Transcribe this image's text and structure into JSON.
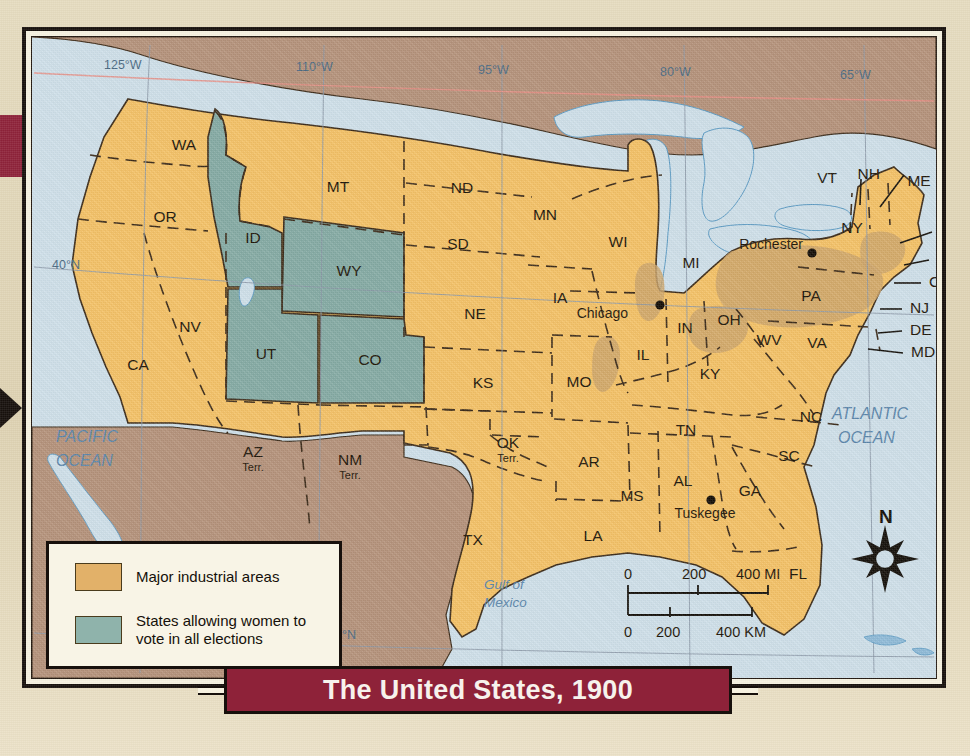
{
  "title": "The United States, 1900",
  "colors": {
    "state_fill": "#f5c266",
    "suffrage_fill": "#85aba4",
    "industrial_fill": "#cda56a",
    "foreign_fill": "#b5927a",
    "water": "#cfe0ea",
    "banner": "#8e2239",
    "border": "#17100c",
    "paper": "#ded2b2"
  },
  "legend": {
    "items": [
      {
        "swatch_color": "#e2b169",
        "label": "Major industrial areas"
      },
      {
        "swatch_color": "#8fb3ab",
        "label": "States allowing women to\nvote in all elections"
      }
    ]
  },
  "graticule": {
    "longitude_labels": [
      "125°W",
      "110°W",
      "95°W",
      "80°W",
      "65°W"
    ],
    "latitude_labels": [
      "40°N",
      "25°N"
    ]
  },
  "oceans": [
    {
      "name": "PACIFIC OCEAN",
      "line1": "PACIFIC",
      "line2": "OCEAN"
    },
    {
      "name": "ATLANTIC OCEAN",
      "line1": "ATLANTIC",
      "line2": "OCEAN"
    },
    {
      "name": "Gulf of Mexico",
      "line1": "Gulf of",
      "line2": "Mexico"
    }
  ],
  "compass": {
    "label": "N",
    "icon": "compass-rose-icon"
  },
  "scale_bar": {
    "miles": {
      "ticks": [
        "0",
        "200",
        "400 MI"
      ]
    },
    "kilometers": {
      "ticks": [
        "0",
        "200",
        "400 KM"
      ]
    }
  },
  "cities": [
    {
      "name": "Chicago",
      "x": 628,
      "y": 268,
      "label_x": 596,
      "label_y": 281,
      "anchor": "end"
    },
    {
      "name": "Rochester",
      "x": 780,
      "y": 216,
      "label_x": 771,
      "label_y": 212,
      "anchor": "end"
    },
    {
      "name": "Tuskegee",
      "x": 679,
      "y": 463,
      "label_x": 673,
      "label_y": 481,
      "anchor": "middle"
    }
  ],
  "states": [
    {
      "code": "WA",
      "x": 152,
      "y": 113,
      "sub": ""
    },
    {
      "code": "OR",
      "x": 133,
      "y": 185,
      "sub": ""
    },
    {
      "code": "ID",
      "x": 221,
      "y": 206,
      "sub": ""
    },
    {
      "code": "MT",
      "x": 306,
      "y": 155,
      "sub": ""
    },
    {
      "code": "ND",
      "x": 430,
      "y": 156,
      "sub": ""
    },
    {
      "code": "SD",
      "x": 426,
      "y": 212,
      "sub": ""
    },
    {
      "code": "WY",
      "x": 317,
      "y": 239,
      "sub": ""
    },
    {
      "code": "NE",
      "x": 443,
      "y": 282,
      "sub": ""
    },
    {
      "code": "NV",
      "x": 158,
      "y": 295,
      "sub": ""
    },
    {
      "code": "CA",
      "x": 106,
      "y": 333,
      "sub": ""
    },
    {
      "code": "UT",
      "x": 234,
      "y": 322,
      "sub": ""
    },
    {
      "code": "CO",
      "x": 338,
      "y": 328,
      "sub": ""
    },
    {
      "code": "KS",
      "x": 451,
      "y": 351,
      "sub": ""
    },
    {
      "code": "MN",
      "x": 513,
      "y": 183,
      "sub": ""
    },
    {
      "code": "WI",
      "x": 586,
      "y": 210,
      "sub": ""
    },
    {
      "code": "MI",
      "x": 659,
      "y": 231,
      "sub": ""
    },
    {
      "code": "IA",
      "x": 528,
      "y": 266,
      "sub": ""
    },
    {
      "code": "IL",
      "x": 611,
      "y": 323,
      "sub": ""
    },
    {
      "code": "IN",
      "x": 653,
      "y": 296,
      "sub": ""
    },
    {
      "code": "OH",
      "x": 697,
      "y": 288,
      "sub": ""
    },
    {
      "code": "MO",
      "x": 547,
      "y": 350,
      "sub": ""
    },
    {
      "code": "KY",
      "x": 678,
      "y": 342,
      "sub": ""
    },
    {
      "code": "TN",
      "x": 654,
      "y": 398,
      "sub": ""
    },
    {
      "code": "WV",
      "x": 737,
      "y": 308,
      "sub": ""
    },
    {
      "code": "VA",
      "x": 785,
      "y": 311,
      "sub": ""
    },
    {
      "code": "NC",
      "x": 779,
      "y": 385,
      "sub": ""
    },
    {
      "code": "SC",
      "x": 757,
      "y": 424,
      "sub": ""
    },
    {
      "code": "GA",
      "x": 718,
      "y": 459,
      "sub": ""
    },
    {
      "code": "AL",
      "x": 651,
      "y": 449,
      "sub": ""
    },
    {
      "code": "MS",
      "x": 600,
      "y": 464,
      "sub": ""
    },
    {
      "code": "AR",
      "x": 557,
      "y": 430,
      "sub": ""
    },
    {
      "code": "LA",
      "x": 561,
      "y": 504,
      "sub": ""
    },
    {
      "code": "FL",
      "x": 766,
      "y": 542,
      "sub": ""
    },
    {
      "code": "TX",
      "x": 441,
      "y": 508,
      "sub": ""
    },
    {
      "code": "OK",
      "x": 476,
      "y": 411,
      "sub": "Terr."
    },
    {
      "code": "NM",
      "x": 318,
      "y": 428,
      "sub": "Terr."
    },
    {
      "code": "AZ",
      "x": 221,
      "y": 420,
      "sub": "Terr."
    },
    {
      "code": "PA",
      "x": 779,
      "y": 264,
      "sub": ""
    },
    {
      "code": "NY",
      "x": 820,
      "y": 196,
      "sub": ""
    },
    {
      "code": "ME",
      "x": 887,
      "y": 149,
      "sub": ""
    }
  ],
  "callout_states": [
    {
      "code": "VT",
      "label_x": 805,
      "label_y": 146
    },
    {
      "code": "NH",
      "label_x": 848,
      "label_y": 142
    },
    {
      "code": "MA",
      "label_x": 908,
      "label_y": 199
    },
    {
      "code": "RI",
      "label_x": 905,
      "label_y": 227
    },
    {
      "code": "CT",
      "label_x": 897,
      "label_y": 250
    },
    {
      "code": "NJ",
      "label_x": 878,
      "label_y": 276
    },
    {
      "code": "DE",
      "label_x": 878,
      "label_y": 298
    },
    {
      "code": "MD",
      "label_x": 879,
      "label_y": 320
    }
  ]
}
